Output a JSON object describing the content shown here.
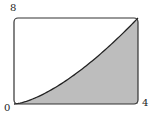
{
  "diagram": {
    "curve": "y = x^(3/2)",
    "x_range": [
      0,
      4
    ],
    "y_range": [
      0,
      8
    ],
    "labels": {
      "y_max": "8",
      "origin": "0",
      "x_max": "4"
    },
    "colors": {
      "fill": "#bdbdbd",
      "stroke": "#222222",
      "background": "#ffffff"
    }
  }
}
